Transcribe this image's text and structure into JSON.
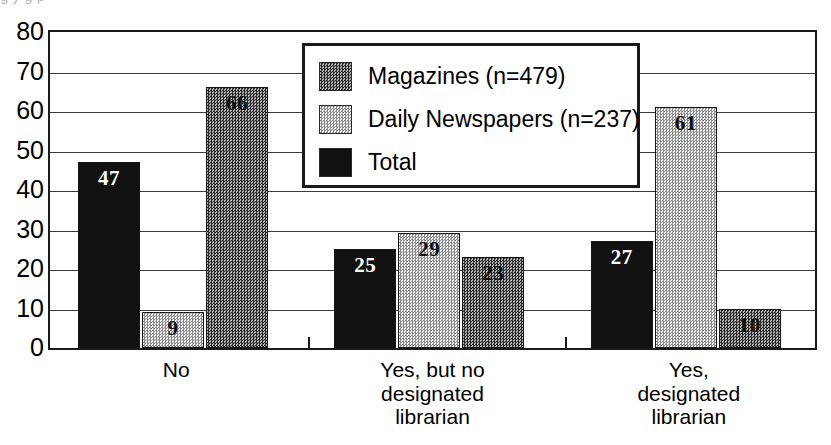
{
  "chart_data": {
    "type": "bar",
    "title": "",
    "xlabel": "",
    "ylabel": "",
    "ylim": [
      0,
      80
    ],
    "ytick_step": 10,
    "yticks": [
      "80",
      "70",
      "60",
      "50",
      "40",
      "30",
      "20",
      "10",
      "0"
    ],
    "grid": true,
    "legend_position": "top-center",
    "categories": [
      "No",
      "Yes, but no designated librarian",
      "Yes, designated librarian"
    ],
    "category_lines": [
      [
        "No"
      ],
      [
        "Yes, but no",
        "designated",
        "librarian"
      ],
      [
        "Yes,",
        "designated",
        "librarian"
      ]
    ],
    "series": [
      {
        "name": "Total",
        "key": "total",
        "values": [
          47,
          25,
          27
        ],
        "color": "#111111",
        "fill": "solid-black"
      },
      {
        "name": "Daily Newspapers (n=237)",
        "key": "daily",
        "values": [
          9,
          29,
          61
        ],
        "color": "#d8d8d8",
        "fill": "light-dither"
      },
      {
        "name": "Magazines (n=479)",
        "key": "mag",
        "values": [
          66,
          23,
          10
        ],
        "color": "#6e6e6e",
        "fill": "dark-dither"
      }
    ],
    "legend_entries": [
      {
        "label": "Magazines (n=479)",
        "swatch": "mag"
      },
      {
        "label": "Daily Newspapers (n=237)",
        "swatch": "daily"
      },
      {
        "label": "Total",
        "swatch": "total"
      }
    ],
    "bar_order_in_group": [
      "total",
      "daily",
      "mag"
    ],
    "data_labels": [
      {
        "group": 0,
        "series": "total",
        "text": "47"
      },
      {
        "group": 0,
        "series": "daily",
        "text": "9"
      },
      {
        "group": 0,
        "series": "mag",
        "text": "66"
      },
      {
        "group": 1,
        "series": "total",
        "text": "25"
      },
      {
        "group": 1,
        "series": "daily",
        "text": "29"
      },
      {
        "group": 1,
        "series": "mag",
        "text": "23"
      },
      {
        "group": 2,
        "series": "total",
        "text": "27"
      },
      {
        "group": 2,
        "series": "daily",
        "text": "61"
      },
      {
        "group": 2,
        "series": "mag",
        "text": "10"
      }
    ]
  },
  "top_crop": {
    "text": "g  y            g        p"
  }
}
